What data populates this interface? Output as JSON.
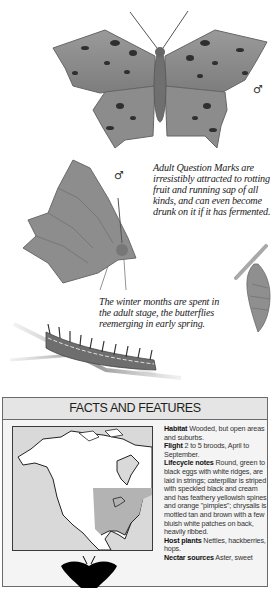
{
  "page": {
    "illustrations": {
      "adult_dorsal": {
        "label": "Question Mark butterfly, upper wing view",
        "sex_symbol": "♂"
      },
      "adult_ventral": {
        "label": "Question Mark butterfly, side view with wings closed",
        "sex_symbol": "♂"
      },
      "chrysalis": {
        "label": "Chrysalis hanging from twig"
      },
      "caterpillar": {
        "label": "Spiny caterpillar on twig"
      }
    },
    "captions": {
      "adult_feeding": "Adult Question Marks are irresistibly attracted to rotting fruit and running sap of all kinds, and can even become drunk on it if it has fermented.",
      "overwintering": "The winter months are spent in the adult stage, the butterflies reemerging in early spring."
    },
    "facts": {
      "title": "FACTS AND FEATURES",
      "map_label": "Range map of North America",
      "silhouette_label": "Actual size silhouette",
      "entries": [
        {
          "label": "Habitat",
          "text": "Wooded, but open areas and suburbs."
        },
        {
          "label": "Flight",
          "text": "2 to 5 broods, April to September."
        },
        {
          "label": "Lifecycle notes",
          "text": "Round, green to black eggs with white ridges, are laid in strings; caterpillar is striped with speckled black and cream and has feathery yellowish spines and orange \"pimples\"; chrysalis is mottled tan and brown with a few bluish white patches on back, heavily ribbed."
        },
        {
          "label": "Host plants",
          "text": "Nettles, hackberries, hops."
        },
        {
          "label": "Nectar sources",
          "text": "Aster, sweet"
        }
      ]
    },
    "colors": {
      "header_bg": "#e5e5e5",
      "box_bg": "#f4f4f4",
      "map_water": "#d9d9d9",
      "map_range": "#b3b3b3",
      "border": "#6a6a6a"
    }
  }
}
